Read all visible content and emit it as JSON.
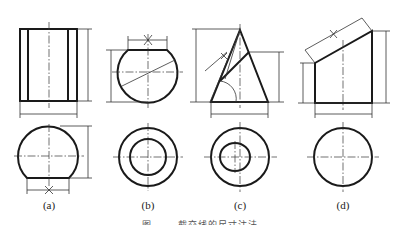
{
  "figure": {
    "views": [
      {
        "id": "a",
        "label": "(a)",
        "description": "Cylinder with partial sphere — front view rectangle with inner lines; top view truncated circle with dimension X"
      },
      {
        "id": "b",
        "label": "(b)",
        "description": "Truncated sphere with inclined line — front view; top view concentric circles"
      },
      {
        "id": "c",
        "label": "(c)",
        "description": "Cone cut by inclined plane — front view with angled dimension X; top view circle with inner ellipse"
      },
      {
        "id": "d",
        "label": "(d)",
        "description": "Cylinder cut by inclined plane — front view trapezoid with inclined dimension X; top view circle"
      }
    ],
    "dimension_mark": "X",
    "caption": "图 ·· ·· 截交线的尺寸注法"
  }
}
